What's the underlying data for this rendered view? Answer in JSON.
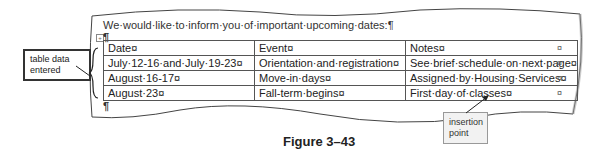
{
  "document": {
    "intro_text": "We·would·like·to·inform·you·of·important·upcoming·dates:¶",
    "para_mark": "¶",
    "table_handle": "+",
    "table": {
      "rows": [
        [
          "Date¤",
          "Event¤",
          "Notes¤"
        ],
        [
          "July·12-16·and·July·19-23¤",
          "Orientation·and·registration¤",
          "See·brief·schedule·on·next·page¤"
        ],
        [
          "August·16-17¤",
          "Move-in·days¤",
          "Assigned·by·Housing·Services¤"
        ],
        [
          "August·23¤",
          "Fall-term·begins¤",
          "First·day·of·classes¤"
        ]
      ],
      "end_of_row_marks": [
        "¤",
        "¤",
        "¤",
        "¤"
      ]
    }
  },
  "callouts": {
    "table_data": "table data entered",
    "insertion_point": "insertion point"
  },
  "figure_caption": "Figure 3–43"
}
